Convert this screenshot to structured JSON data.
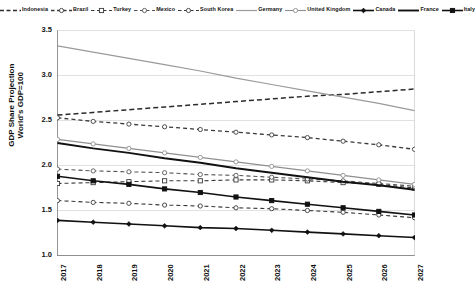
{
  "chart_data": {
    "type": "line",
    "title": "",
    "xlabel": "",
    "ylabel": "GDP Share Projection World's GDP=100",
    "ylabel_line1": "GDP Share Projection",
    "ylabel_line2": "World's GDP=100",
    "x": [
      2017,
      2018,
      2019,
      2020,
      2021,
      2022,
      2023,
      2024,
      2025,
      2026,
      2027
    ],
    "categories": [
      "2017",
      "2018",
      "2019",
      "2020",
      "2021",
      "2022",
      "2023",
      "2024",
      "2025",
      "2026",
      "2027"
    ],
    "ylim": [
      1.0,
      3.5
    ],
    "yticks": [
      1.0,
      1.5,
      2.0,
      2.5,
      3.0,
      3.5
    ],
    "ytick_labels": [
      "1.0",
      "1.5",
      "2.0",
      "2.5",
      "3.0",
      "3.5"
    ],
    "grid": true,
    "legend_position": "top",
    "series": [
      {
        "name": "Indonesia",
        "style": "dashed",
        "marker": "none",
        "color": "#2b2b2b",
        "width": 1.5,
        "values": [
          2.56,
          2.59,
          2.62,
          2.65,
          2.68,
          2.71,
          2.74,
          2.77,
          2.79,
          2.82,
          2.85
        ]
      },
      {
        "name": "Brazil",
        "style": "dashed",
        "marker": "circle",
        "color": "#3a3a3a",
        "width": 1.3,
        "values": [
          2.53,
          2.49,
          2.46,
          2.43,
          2.4,
          2.37,
          2.34,
          2.31,
          2.27,
          2.23,
          2.18
        ]
      },
      {
        "name": "Turkey",
        "style": "dashed",
        "marker": "square",
        "color": "#3a3a3a",
        "width": 1.1,
        "values": [
          1.8,
          1.81,
          1.82,
          1.83,
          1.83,
          1.84,
          1.84,
          1.83,
          1.81,
          1.79,
          1.75
        ]
      },
      {
        "name": "Mexico",
        "style": "dashed",
        "marker": "circle",
        "color": "#555555",
        "width": 1.1,
        "values": [
          1.96,
          1.94,
          1.93,
          1.92,
          1.9,
          1.89,
          1.87,
          1.85,
          1.83,
          1.8,
          1.77
        ]
      },
      {
        "name": "South Korea",
        "style": "dashed",
        "marker": "circle",
        "color": "#3a3a3a",
        "width": 1.1,
        "values": [
          1.61,
          1.59,
          1.58,
          1.56,
          1.55,
          1.53,
          1.52,
          1.5,
          1.48,
          1.45,
          1.42
        ]
      },
      {
        "name": "Germany",
        "style": "solid",
        "marker": "none",
        "color": "#9a9a9a",
        "width": 1.2,
        "values": [
          3.33,
          3.26,
          3.19,
          3.12,
          3.05,
          2.97,
          2.9,
          2.83,
          2.76,
          2.69,
          2.61
        ]
      },
      {
        "name": "United Kingdom",
        "style": "solid",
        "marker": "circle",
        "color": "#8f8f8f",
        "width": 1.1,
        "values": [
          2.29,
          2.24,
          2.19,
          2.14,
          2.09,
          2.04,
          1.99,
          1.94,
          1.89,
          1.84,
          1.79
        ]
      },
      {
        "name": "Canada",
        "style": "solid",
        "marker": "diamond",
        "color": "#111111",
        "width": 1.6,
        "values": [
          1.39,
          1.37,
          1.35,
          1.33,
          1.31,
          1.3,
          1.28,
          1.26,
          1.24,
          1.22,
          1.2
        ]
      },
      {
        "name": "France",
        "style": "solid",
        "marker": "none",
        "color": "#111111",
        "width": 1.9,
        "values": [
          2.25,
          2.19,
          2.14,
          2.08,
          2.03,
          1.97,
          1.92,
          1.87,
          1.82,
          1.78,
          1.73
        ]
      },
      {
        "name": "Italy",
        "style": "solid",
        "marker": "square",
        "color": "#111111",
        "width": 1.6,
        "values": [
          1.88,
          1.83,
          1.79,
          1.74,
          1.7,
          1.65,
          1.61,
          1.57,
          1.53,
          1.49,
          1.45
        ]
      }
    ]
  }
}
